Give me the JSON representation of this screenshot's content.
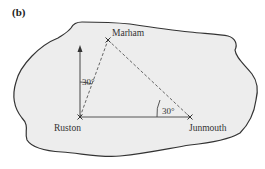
{
  "figure": {
    "part_label": "(b)",
    "places": {
      "marham": "Marham",
      "ruston": "Ruston",
      "junmouth": "Junmouth"
    },
    "angles": {
      "at_ruston": "30°",
      "at_junmouth": "30°"
    },
    "colors": {
      "island_fill": "#ededed",
      "outline": "#333333",
      "lines": "#555555"
    }
  }
}
